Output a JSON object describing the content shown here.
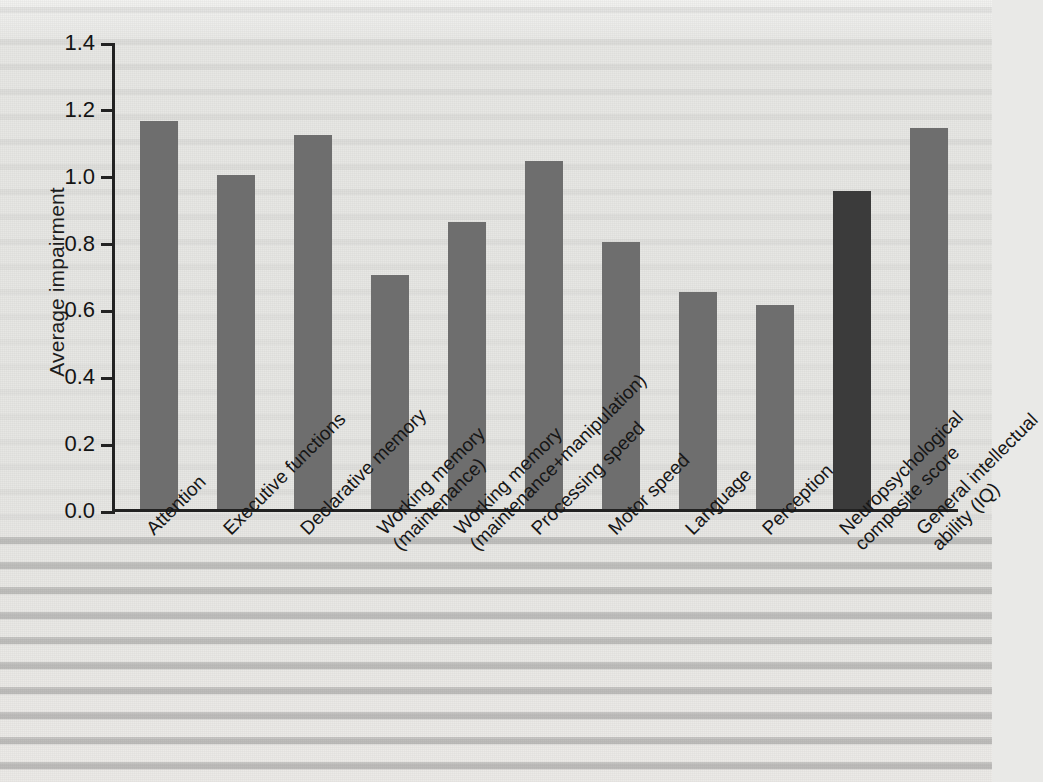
{
  "figure": {
    "background_color": "#e9e9e7",
    "bar_color": "#6e6e6e",
    "highlight_bar_color": "#3b3b3b",
    "axis_color": "#222222"
  },
  "chart_data": {
    "type": "bar",
    "title": "",
    "xlabel": "",
    "ylabel": "Average impairment",
    "ylim": [
      0.0,
      1.4
    ],
    "yticks": [
      "0.0",
      "0.2",
      "0.4",
      "0.6",
      "0.8",
      "1.0",
      "1.2",
      "1.4"
    ],
    "ytick_values": [
      0.0,
      0.2,
      0.4,
      0.6,
      0.8,
      1.0,
      1.2,
      1.4
    ],
    "grid": false,
    "legend": null,
    "categories": [
      "Attention",
      "Executive functions",
      "Declarative memory",
      "Working memory (maintenance)",
      "Working memory (maintenance+manipulation)",
      "Processing speed",
      "Motor speed",
      "Language",
      "Perception",
      "Neuropsychological composite score",
      "General intellectual ability (IQ)"
    ],
    "category_lines": [
      [
        "Attention"
      ],
      [
        "Executive functions"
      ],
      [
        "Declarative memory"
      ],
      [
        "Working memory",
        "(maintenance)"
      ],
      [
        "Working memory",
        "(maintenance+manipulation)"
      ],
      [
        "Processing speed"
      ],
      [
        "Motor speed"
      ],
      [
        "Language"
      ],
      [
        "Perception"
      ],
      [
        "Neuropsychological",
        "composite score"
      ],
      [
        "General intellectual",
        "ability (IQ)"
      ]
    ],
    "values": [
      1.16,
      1.0,
      1.12,
      0.7,
      0.86,
      1.04,
      0.8,
      0.65,
      0.61,
      0.95,
      1.14
    ],
    "highlighted_index": 9
  }
}
